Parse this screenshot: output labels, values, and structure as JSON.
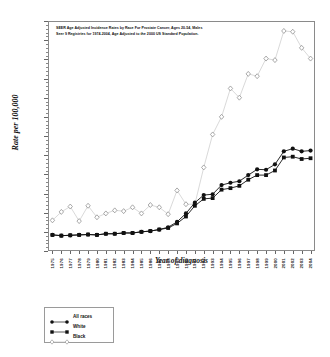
{
  "chart_data": {
    "type": "line",
    "title": "SEER  Age Adjusted Incidence Rates by Race For Prostate Cancer,  Ages 20-54, Males Seer 9 Registries for 1974-2004, Age Adjusted to the 2000 US Standard Population.",
    "title_line1": "SEER  Age Adjusted Incidence Rates by Race For Prostate Cancer,  Ages 20-54, Males",
    "title_line2": "Seer 9 Registries for 1974-2004, Age Adjusted to the 2000 US Standard Population.",
    "xlabel": "Year of diagnosis",
    "ylabel": "Rate per 100,000",
    "ylim": [
      0,
      60
    ],
    "ytick_step": 5,
    "grid": false,
    "legend_position": "below-left",
    "yticks": [
      "0",
      "5",
      "10",
      "15",
      "20",
      "25",
      "30",
      "35",
      "40",
      "45",
      "50",
      "55",
      "60"
    ],
    "categories": [
      "1975",
      "1976",
      "1977",
      "1978",
      "1979",
      "1980",
      "1981",
      "1982",
      "1983",
      "1984",
      "1985",
      "1986",
      "1987",
      "1988",
      "1989",
      "1990",
      "1991",
      "1992",
      "1993",
      "1994",
      "1995",
      "1996",
      "1997",
      "1998",
      "1999",
      "2000",
      "2001",
      "2002",
      "2003",
      "2004"
    ],
    "series": [
      {
        "name": "All races",
        "marker": "filled-circle",
        "color": "#111111",
        "values": [
          4.2,
          4.0,
          4.1,
          4.2,
          4.3,
          4.2,
          4.5,
          4.5,
          4.7,
          4.7,
          5.0,
          5.2,
          5.6,
          6.2,
          7.6,
          9.8,
          12.6,
          14.6,
          14.8,
          17.2,
          17.8,
          18.2,
          19.8,
          21.3,
          21.2,
          22.6,
          26.0,
          26.7,
          26.0,
          26.2
        ]
      },
      {
        "name": "White",
        "marker": "filled-square",
        "color": "#111111",
        "values": [
          4.2,
          4.0,
          4.1,
          4.2,
          4.3,
          4.2,
          4.5,
          4.5,
          4.7,
          4.7,
          5.0,
          5.2,
          5.6,
          6.0,
          7.2,
          9.0,
          11.8,
          13.6,
          13.8,
          16.0,
          16.4,
          17.0,
          18.6,
          19.8,
          19.8,
          21.0,
          24.4,
          24.6,
          24.0,
          24.2
        ]
      },
      {
        "name": "Black",
        "marker": "open-diamond",
        "color": "#b9b9b9",
        "values": [
          8.0,
          10.2,
          11.6,
          7.8,
          11.8,
          8.8,
          9.8,
          10.6,
          10.4,
          11.4,
          9.8,
          12.0,
          11.4,
          9.6,
          15.8,
          12.2,
          12.2,
          21.8,
          30.4,
          35.0,
          42.4,
          40.0,
          46.2,
          45.6,
          50.2,
          49.8,
          57.4,
          57.2,
          53.0,
          50.2
        ]
      }
    ]
  },
  "legend": {
    "items": [
      {
        "label": "All races",
        "marker": "filled-circle"
      },
      {
        "label": "White",
        "marker": "filled-square"
      },
      {
        "label": "Black",
        "marker": "open-diamond"
      }
    ]
  }
}
